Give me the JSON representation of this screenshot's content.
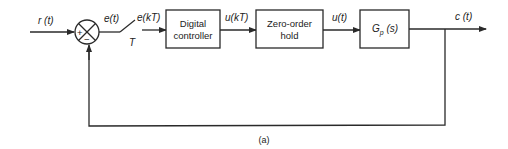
{
  "diagram": {
    "type": "block-diagram",
    "caption": "(a)",
    "signals": {
      "input": "r (t)",
      "error": "e(t)",
      "sampled_error": "e(kT)",
      "sampler_period": "T",
      "controller_output": "u(kT)",
      "hold_output": "u(t)",
      "output": "c (t)"
    },
    "summing_junction": {
      "plus": "+",
      "minus": "−"
    },
    "blocks": [
      {
        "id": "digital-controller",
        "line1": "Digital",
        "line2": "controller"
      },
      {
        "id": "zero-order-hold",
        "line1": "Zero-order",
        "line2": "hold"
      },
      {
        "id": "plant",
        "main": "G",
        "sub": "p",
        "arg": " (s)"
      }
    ],
    "colors": {
      "line": "#2a2a2a",
      "background": "#ffffff"
    }
  }
}
